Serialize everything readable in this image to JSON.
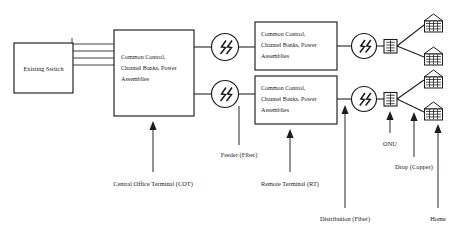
{
  "diagram": {
    "colors": {
      "background": "#ffffff",
      "stroke": "#1c1c1c",
      "text": "#1a1a1a"
    },
    "nodes": {
      "existing_switch": {
        "label": "Existing Switch"
      },
      "cot": {
        "line1": "Common Control,",
        "line2": "Channel Banks, Power",
        "line3": "Assemblies"
      },
      "rt_upper": {
        "line1": "Common Control,",
        "line2": "Channel Banks, Power",
        "line3": "Assemblies"
      },
      "rt_lower": {
        "line1": "Common Control,",
        "line2": "Channel Banks, Power",
        "line3": "Assemblies"
      }
    },
    "icons": {
      "transceiver": "optical-transceiver-icon",
      "onu": "onu-icon",
      "home": "home-icon",
      "trunk_lines_count": 4
    },
    "callouts": {
      "cot": "Central Office Terminal (COT)",
      "feeder": "Feeder (Fiber)",
      "rt": "Remote Terminal (RT)",
      "distribution": "Distribution (Fiber)",
      "onu": "ONU",
      "drop": "Drop (Copper)",
      "home": "Home"
    }
  }
}
